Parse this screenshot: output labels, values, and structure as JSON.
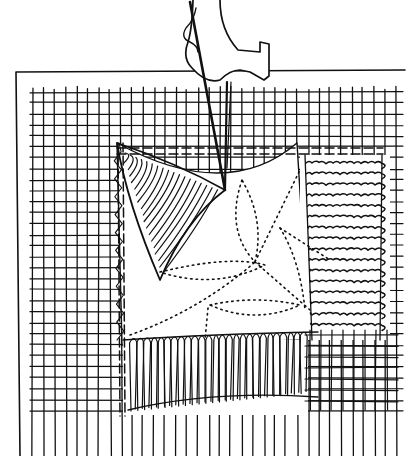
{
  "illustration": {
    "title": "Sewing machine needle stitching a fabric square",
    "subject": "pen-and-ink drawing",
    "ink_color": "#111111",
    "paper_color": "#ffffff",
    "presser_foot": {
      "x": 188,
      "y": 0,
      "w": 60,
      "h": 82
    },
    "needle": {
      "x1": 190,
      "y1": 2,
      "x2": 225,
      "y2": 190
    },
    "thread": {
      "x1": 227,
      "y1": 82,
      "x2": 225,
      "y2": 188
    },
    "outer_frame": {
      "top": 72,
      "left": 16,
      "right": 405,
      "bottom": 456
    },
    "mesh": {
      "x": 33,
      "y": 88,
      "w": 370,
      "h": 368,
      "step": 11
    },
    "inner_window": {
      "x": 117,
      "y": 143,
      "w": 190,
      "h": 197
    },
    "dashed_border": {
      "top_y": 148,
      "left_x": 118
    },
    "hatched_triangle": {
      "ax": 117,
      "ay": 143,
      "bx": 225,
      "by": 190,
      "cx": 160,
      "cy": 280
    },
    "right_band": {
      "x": 300,
      "y": 155,
      "w": 90,
      "h": 185,
      "rows": 16
    },
    "bottom_band": {
      "x": 123,
      "y": 340,
      "w": 185,
      "h": 75,
      "cols": 26
    }
  }
}
